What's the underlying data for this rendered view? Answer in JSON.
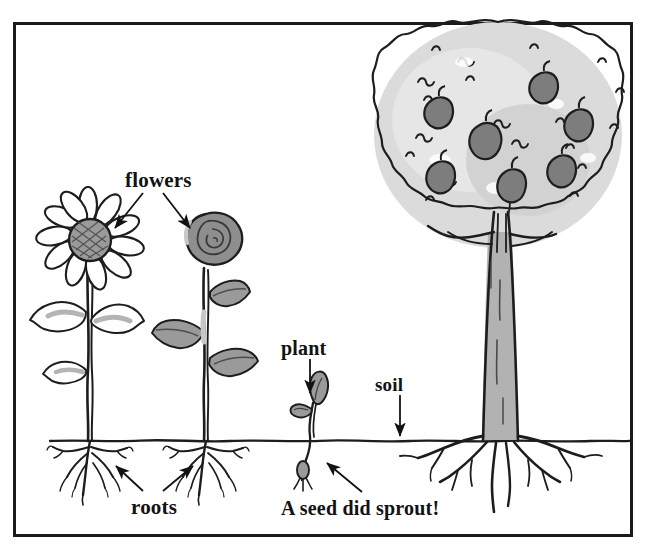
{
  "figure": {
    "background_color": "#ffffff",
    "frame_color": "#1a1a1a",
    "ink_color": "#121212",
    "fill_gray": "#8e8e8e",
    "leaf_gray": "#9a9a9a",
    "canopy_gray": "#d6d6d6",
    "apple_gray": "#7d7d7d",
    "trunk_gray": "#b2b2b2"
  },
  "labels": {
    "flowers": "flowers",
    "plant": "plant",
    "soil": "soil",
    "roots": "roots",
    "caption": "A seed did sprout!"
  },
  "scene": {
    "ground_line_label": "soil-line",
    "objects": [
      {
        "name": "sunflower",
        "has_flower": true,
        "leaves": 3,
        "has_roots": true
      },
      {
        "name": "rose",
        "has_flower": true,
        "leaves": 3,
        "has_roots": true
      },
      {
        "name": "sprout",
        "has_flower": false,
        "leaves": 2,
        "has_seed": true
      },
      {
        "name": "apple-tree",
        "apples": 7,
        "has_roots": true
      }
    ]
  },
  "annotations": [
    {
      "label": "flowers",
      "arrows": 2,
      "targets": [
        "sunflower-bloom",
        "rose-bloom"
      ]
    },
    {
      "label": "plant",
      "arrows": 1,
      "targets": [
        "sprout-leaf"
      ]
    },
    {
      "label": "soil",
      "arrows": 1,
      "targets": [
        "soil-line"
      ]
    },
    {
      "label": "roots",
      "arrows": 2,
      "targets": [
        "sunflower-roots",
        "rose-roots"
      ]
    },
    {
      "label": "A seed did sprout!",
      "arrows": 1,
      "targets": [
        "seed"
      ]
    }
  ]
}
